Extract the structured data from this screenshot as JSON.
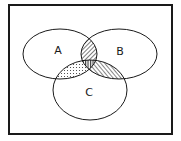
{
  "diagram": {
    "type": "venn",
    "universe": {
      "x": 9,
      "y": 5,
      "width": 163,
      "height": 129,
      "stroke": "#1a1a1a",
      "stroke_width": 2
    },
    "sets": [
      {
        "id": "A",
        "label": "A",
        "cx": 60,
        "cy": 54,
        "rx": 37,
        "ry": 25,
        "label_x": 58,
        "label_y": 54
      },
      {
        "id": "B",
        "label": "B",
        "cx": 119,
        "cy": 54,
        "rx": 38,
        "ry": 25,
        "label_x": 120,
        "label_y": 55
      },
      {
        "id": "C",
        "label": "C",
        "cx": 90,
        "cy": 90,
        "rx": 37,
        "ry": 30,
        "label_x": 89,
        "label_y": 96
      }
    ],
    "shaded_regions": [
      {
        "id": "A-and-B",
        "sets": [
          "A",
          "B"
        ],
        "pattern": "diagonal-hatch-dense"
      },
      {
        "id": "A-and-C",
        "sets": [
          "A",
          "C"
        ],
        "pattern": "dots"
      },
      {
        "id": "B-and-C",
        "sets": [
          "B",
          "C"
        ],
        "pattern": "diagonal-hatch"
      },
      {
        "id": "A-and-B-and-C",
        "sets": [
          "A",
          "B",
          "C"
        ],
        "pattern": "vertical-hatch"
      }
    ],
    "line_color": "#1a1a1a",
    "background": "#ffffff"
  }
}
